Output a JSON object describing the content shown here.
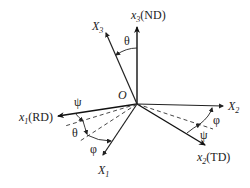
{
  "diagram": {
    "type": "euler-angle-coordinate-systems",
    "origin_label": "O",
    "sample_axes": [
      {
        "id": "x1",
        "label": "x",
        "sub": "1",
        "suffix": "(RD)"
      },
      {
        "id": "x2",
        "label": "x",
        "sub": "2",
        "suffix": "(TD)"
      },
      {
        "id": "x3",
        "label": "x",
        "sub": "3",
        "suffix": "(ND)"
      }
    ],
    "crystal_axes": [
      {
        "id": "X1",
        "label": "X",
        "sub": "1"
      },
      {
        "id": "X2",
        "label": "X",
        "sub": "2"
      },
      {
        "id": "X3",
        "label": "X",
        "sub": "3"
      }
    ],
    "angles": {
      "theta_top": "θ",
      "psi_left": "ψ",
      "theta_left": "θ",
      "phi_left": "φ",
      "phi_right": "φ",
      "psi_right": "ψ"
    },
    "colors": {
      "line": "#222222",
      "background": "#ffffff"
    }
  }
}
